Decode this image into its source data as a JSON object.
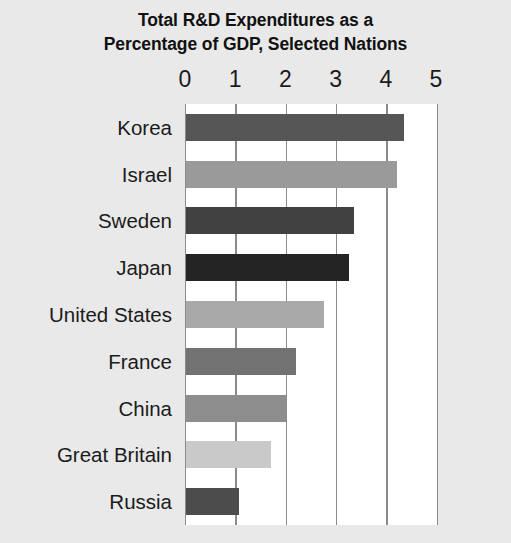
{
  "chart_data": {
    "type": "bar",
    "orientation": "horizontal",
    "title": "Total R&D Expenditures as a Percentage of GDP, Selected Nations",
    "title_lines": [
      "Total R&D Expenditures as a",
      "Percentage of GDP, Selected Nations"
    ],
    "xlabel": "",
    "ylabel": "",
    "xlim": [
      0,
      5
    ],
    "xticks": [
      0,
      1,
      2,
      3,
      4,
      5
    ],
    "xtick_labels": [
      "0",
      "1",
      "2",
      "3",
      "4",
      "5"
    ],
    "grid": "vertical",
    "legend": "none",
    "axis_position": "top",
    "categories": [
      "Korea",
      "Israel",
      "Sweden",
      "Japan",
      "United States",
      "France",
      "China",
      "Great Britain",
      "Russia"
    ],
    "values": [
      4.35,
      4.2,
      3.35,
      3.25,
      2.75,
      2.2,
      2.0,
      1.7,
      1.05
    ],
    "bar_colors": [
      "#565656",
      "#9a9a9a",
      "#414141",
      "#242424",
      "#a9a9a9",
      "#727272",
      "#8d8d8d",
      "#c9c9c9",
      "#4c4c4c"
    ],
    "series": [
      {
        "name": "R&D as % of GDP",
        "values": [
          4.35,
          4.2,
          3.35,
          3.25,
          2.75,
          2.2,
          2.0,
          1.7,
          1.05
        ]
      }
    ],
    "colors": {
      "background": "#e9e9e9",
      "plot_background": "#ffffff",
      "gridline": "#8b8b8b",
      "text": "#1b1b1b",
      "title_text": "#111111"
    }
  }
}
